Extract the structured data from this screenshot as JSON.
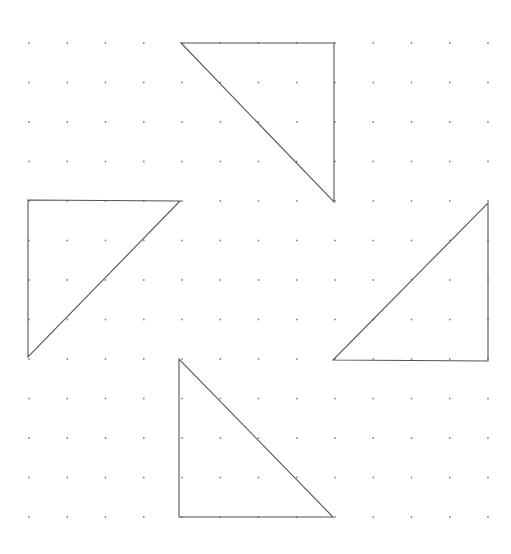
{
  "canvas": {
    "width": 511,
    "height": 554,
    "background": "#ffffff"
  },
  "grid": {
    "cols": 13,
    "rows": 13,
    "x0": 29,
    "y0": 43,
    "dx": 38.25,
    "dy": 39.5,
    "dot_radius": 0.9,
    "dot_color": "#8a8a8a"
  },
  "stroke_color": "#555555",
  "triangles": [
    {
      "name": "triangle-top",
      "points": [
        [
          181,
          43
        ],
        [
          334,
          43
        ],
        [
          334,
          202
        ]
      ]
    },
    {
      "name": "triangle-left",
      "points": [
        [
          28,
          200
        ],
        [
          180,
          201
        ],
        [
          28,
          357
        ]
      ]
    },
    {
      "name": "triangle-right",
      "points": [
        [
          488,
          203
        ],
        [
          488,
          361
        ],
        [
          333,
          360
        ]
      ]
    },
    {
      "name": "triangle-bottom",
      "points": [
        [
          179,
          359
        ],
        [
          179,
          517
        ],
        [
          333,
          517
        ]
      ]
    }
  ]
}
